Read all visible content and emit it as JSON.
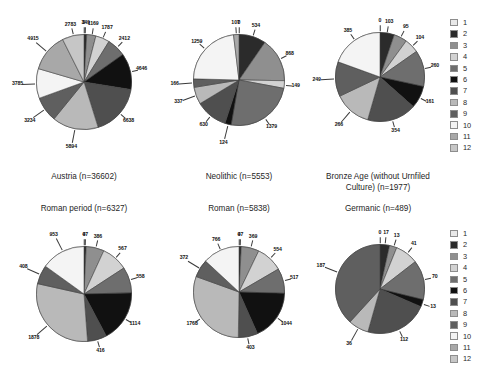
{
  "figure": {
    "background": "#ffffff",
    "palette": [
      "#e8e8e8",
      "#2b2b2b",
      "#8f8f8f",
      "#d2d2d2",
      "#6e6e6e",
      "#111111",
      "#4f4f4f",
      "#b9b9b9",
      "#5f5f5f",
      "#f4f4f4",
      "#a8a8a8",
      "#c6c6c6"
    ]
  },
  "legend": {
    "name": "category-legend",
    "items": [
      {
        "label": "1",
        "color": "#e8e8e8"
      },
      {
        "label": "2",
        "color": "#2b2b2b"
      },
      {
        "label": "3",
        "color": "#8f8f8f"
      },
      {
        "label": "4",
        "color": "#d2d2d2"
      },
      {
        "label": "5",
        "color": "#6e6e6e"
      },
      {
        "label": "6",
        "color": "#111111"
      },
      {
        "label": "7",
        "color": "#4f4f4f"
      },
      {
        "label": "8",
        "color": "#b9b9b9"
      },
      {
        "label": "9",
        "color": "#5f5f5f"
      },
      {
        "label": "10",
        "color": "#f4f4f4"
      },
      {
        "label": "11",
        "color": "#a8a8a8"
      },
      {
        "label": "12",
        "color": "#c6c6c6"
      }
    ]
  },
  "chart_data": [
    {
      "id": "austria",
      "type": "pie",
      "title": "Austria (n=36602)",
      "total": 36602,
      "categories": [
        "1",
        "2",
        "3",
        "4",
        "5",
        "6",
        "7",
        "8",
        "9",
        "10",
        "11",
        "12"
      ],
      "values": [
        0,
        349,
        1169,
        1787,
        2412,
        4646,
        6638,
        5894,
        3234,
        3785,
        4915,
        2783
      ],
      "legend_position": "right-shared"
    },
    {
      "id": "neolithic",
      "type": "pie",
      "title": "Neolithic (n=5553)",
      "total": 5553,
      "categories": [
        "1",
        "2",
        "3",
        "4",
        "5",
        "6",
        "7",
        "8",
        "9",
        "10",
        "11",
        "12"
      ],
      "values": [
        0,
        534,
        868,
        149,
        1379,
        124,
        630,
        337,
        166,
        1259,
        107,
        0
      ],
      "legend_position": "right-shared"
    },
    {
      "id": "bronze-age",
      "type": "pie",
      "title": "Bronze Age (without Urnfiled\nCulture) (n=1977)",
      "total": 1977,
      "categories": [
        "1",
        "2",
        "3",
        "4",
        "5",
        "6",
        "7",
        "8",
        "9",
        "10",
        "11",
        "12"
      ],
      "values": [
        0,
        103,
        95,
        104,
        260,
        161,
        354,
        266,
        249,
        385,
        0,
        0
      ],
      "legend_position": "right-shared"
    },
    {
      "id": "roman-period",
      "type": "pie",
      "title": "Roman period (n=6327)",
      "total": 6327,
      "categories": [
        "1",
        "2",
        "3",
        "4",
        "5",
        "6",
        "7",
        "8",
        "9",
        "10",
        "11",
        "12"
      ],
      "values": [
        0,
        47,
        386,
        567,
        558,
        1114,
        416,
        1878,
        408,
        953,
        0,
        0
      ],
      "legend_position": "right-shared"
    },
    {
      "id": "roman",
      "type": "pie",
      "title": "Roman (n=5838)",
      "total": 5838,
      "categories": [
        "1",
        "2",
        "3",
        "4",
        "5",
        "6",
        "7",
        "8",
        "9",
        "10",
        "11",
        "12"
      ],
      "values": [
        0,
        47,
        369,
        554,
        517,
        1044,
        403,
        1768,
        372,
        766,
        0,
        0
      ],
      "legend_position": "right-shared"
    },
    {
      "id": "germanic",
      "type": "pie",
      "title": "Germanic (n=489)",
      "total": 489,
      "categories": [
        "1",
        "2",
        "3",
        "4",
        "5",
        "6",
        "7",
        "8",
        "9",
        "10",
        "11",
        "12"
      ],
      "values": [
        0,
        17,
        13,
        41,
        70,
        13,
        112,
        36,
        187,
        0,
        0,
        0
      ],
      "legend_position": "right-shared"
    }
  ],
  "captions": {
    "austria": "Austria (n=36602)",
    "neolithic": "Neolithic (n=5553)",
    "bronze_age": "Bronze Age (without Urnfiled\nCulture) (n=1977)",
    "roman_period": "Roman period (n=6327)",
    "roman": "Roman (n=5838)",
    "germanic": "Germanic (n=489)"
  }
}
